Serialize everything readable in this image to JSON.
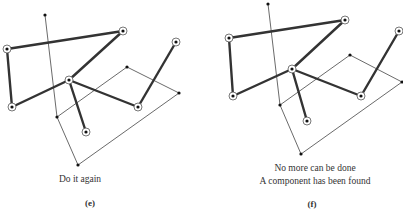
{
  "panels": [
    {
      "id": "e",
      "label": "(e)",
      "caption_lines": [
        "Do it again"
      ],
      "nodes": {
        "A": {
          "x": 45,
          "y": 15,
          "circled": false
        },
        "B": {
          "x": 123,
          "y": 31,
          "circled": true
        },
        "C": {
          "x": 7,
          "y": 49,
          "circled": true
        },
        "D": {
          "x": 176,
          "y": 42,
          "circled": true
        },
        "H": {
          "x": 69,
          "y": 80,
          "circled": true
        },
        "E": {
          "x": 127,
          "y": 67,
          "circled": false
        },
        "F": {
          "x": 179,
          "y": 93,
          "circled": false
        },
        "G": {
          "x": 12,
          "y": 107,
          "circled": true
        },
        "I": {
          "x": 138,
          "y": 107,
          "circled": true
        },
        "J": {
          "x": 57,
          "y": 117,
          "circled": false
        },
        "K": {
          "x": 86,
          "y": 132,
          "circled": true
        },
        "L": {
          "x": 78,
          "y": 165,
          "circled": false
        }
      }
    },
    {
      "id": "f",
      "label": "(f)",
      "caption_lines": [
        "No more can be done",
        "A component has been found"
      ],
      "nodes": {
        "A": {
          "x": 268,
          "y": 4,
          "circled": false
        },
        "B": {
          "x": 345,
          "y": 20,
          "circled": true
        },
        "C": {
          "x": 229,
          "y": 38,
          "circled": true
        },
        "D": {
          "x": 399,
          "y": 31,
          "circled": true
        },
        "H": {
          "x": 292,
          "y": 69,
          "circled": true
        },
        "E": {
          "x": 350,
          "y": 55,
          "circled": false
        },
        "F": {
          "x": 402,
          "y": 82,
          "circled": false
        },
        "G": {
          "x": 233,
          "y": 96,
          "circled": true
        },
        "I": {
          "x": 361,
          "y": 96,
          "circled": true
        },
        "J": {
          "x": 280,
          "y": 105,
          "circled": false
        },
        "K": {
          "x": 307,
          "y": 121,
          "circled": true
        },
        "L": {
          "x": 301,
          "y": 154,
          "circled": false
        }
      }
    }
  ],
  "thick_edges": [
    [
      "C",
      "B"
    ],
    [
      "B",
      "H"
    ],
    [
      "C",
      "G"
    ],
    [
      "G",
      "H"
    ],
    [
      "H",
      "I"
    ],
    [
      "H",
      "K"
    ],
    [
      "I",
      "D"
    ]
  ],
  "thin_edges": [
    [
      "A",
      "J"
    ],
    [
      "J",
      "L"
    ],
    [
      "L",
      "F"
    ],
    [
      "F",
      "E"
    ],
    [
      "E",
      "J"
    ]
  ],
  "colors": {
    "thick": "#333333",
    "thin": "#444444",
    "node": "#111111",
    "ring": "#555555"
  }
}
